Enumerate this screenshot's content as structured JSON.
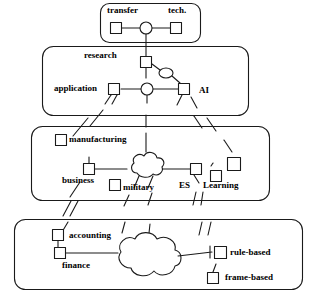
{
  "diagram": {
    "stroke_color": "#1a1a1a",
    "fill_color": "#ffffff",
    "background": "#ffffff",
    "layers": [
      {
        "id": "layer-transfer",
        "labels": [
          {
            "id": "transfer",
            "text": "transfer",
            "x": 107,
            "y": 7
          },
          {
            "id": "tech",
            "text": "tech.",
            "x": 168,
            "y": 7
          }
        ],
        "nodes": [
          {
            "id": "transfer-square-left",
            "shape": "square",
            "cx": 116,
            "cy": 28
          },
          {
            "id": "transfer-circle",
            "shape": "circle",
            "cx": 146,
            "cy": 28
          },
          {
            "id": "tech-square-right",
            "shape": "square",
            "cx": 176,
            "cy": 28
          }
        ]
      },
      {
        "id": "layer-research",
        "labels": [
          {
            "id": "research",
            "text": "research",
            "x": 84,
            "y": 55
          },
          {
            "id": "application",
            "text": "application",
            "x": 56,
            "y": 84
          },
          {
            "id": "ai",
            "text": "AI",
            "x": 200,
            "y": 86
          }
        ],
        "nodes": [
          {
            "id": "research-square",
            "shape": "square",
            "cx": 146,
            "cy": 62
          },
          {
            "id": "research-ellipse",
            "shape": "ellipse",
            "cx": 166,
            "cy": 73
          },
          {
            "id": "application-square",
            "shape": "square",
            "cx": 114,
            "cy": 89
          },
          {
            "id": "application-circle",
            "shape": "circle",
            "cx": 147,
            "cy": 89
          },
          {
            "id": "ai-square",
            "shape": "square",
            "cx": 184,
            "cy": 89
          }
        ]
      },
      {
        "id": "layer-domains",
        "labels": [
          {
            "id": "manufacturing",
            "text": "manufacturing",
            "x": 68,
            "y": 138
          },
          {
            "id": "business",
            "text": "business",
            "x": 62,
            "y": 177
          },
          {
            "id": "military",
            "text": "military",
            "x": 124,
            "y": 187
          },
          {
            "id": "es",
            "text": "ES",
            "x": 180,
            "y": 183
          },
          {
            "id": "learning",
            "text": "Learning",
            "x": 205,
            "y": 183
          }
        ],
        "nodes": [
          {
            "id": "manufacturing-square",
            "shape": "square",
            "cx": 61,
            "cy": 140
          },
          {
            "id": "business-square",
            "shape": "square",
            "cx": 89,
            "cy": 169
          },
          {
            "id": "domains-cloud",
            "shape": "cloud",
            "cx": 143,
            "cy": 167
          },
          {
            "id": "military-square",
            "shape": "square",
            "cx": 115,
            "cy": 185
          },
          {
            "id": "es-square",
            "shape": "square",
            "cx": 196,
            "cy": 169
          },
          {
            "id": "learning-square-small",
            "shape": "square",
            "cx": 215,
            "cy": 175
          },
          {
            "id": "learning-square-large",
            "shape": "square",
            "cx": 233,
            "cy": 164
          }
        ]
      },
      {
        "id": "layer-implementations",
        "labels": [
          {
            "id": "accounting",
            "text": "accounting",
            "x": 70,
            "y": 232
          },
          {
            "id": "finance",
            "text": "finance",
            "x": 63,
            "y": 263
          },
          {
            "id": "rule-based",
            "text": "rule-based",
            "x": 231,
            "y": 250
          },
          {
            "id": "frame-based",
            "text": "frame-based",
            "x": 228,
            "y": 275
          }
        ],
        "nodes": [
          {
            "id": "accounting-square",
            "shape": "square",
            "cx": 58,
            "cy": 234
          },
          {
            "id": "finance-square",
            "shape": "square",
            "cx": 60,
            "cy": 252
          },
          {
            "id": "implementations-cloud",
            "shape": "cloud",
            "cx": 143,
            "cy": 255
          },
          {
            "id": "rule-based-square",
            "shape": "square",
            "cx": 220,
            "cy": 252
          },
          {
            "id": "frame-based-square",
            "shape": "square",
            "cx": 213,
            "cy": 278
          }
        ]
      }
    ]
  }
}
